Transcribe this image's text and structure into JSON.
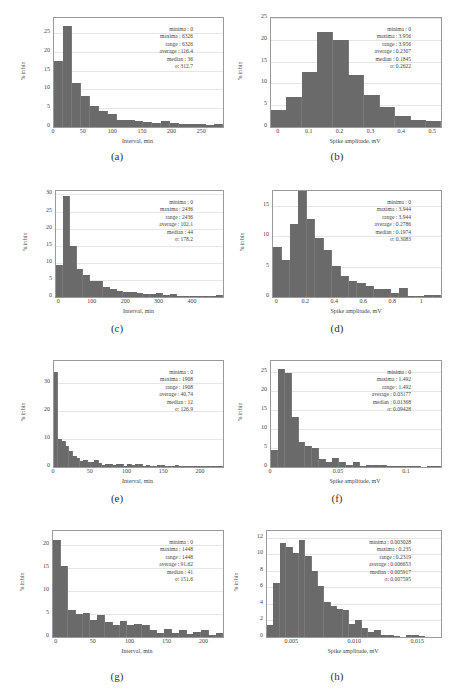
{
  "chart_data": [
    {
      "id": "a",
      "type": "bar",
      "caption": "(a)",
      "xlabel": "Interval, min",
      "ylabel": "% in bin",
      "xlim": [
        0,
        285
      ],
      "ylim": [
        0,
        29
      ],
      "xticks": [
        0,
        50,
        100,
        150,
        200,
        250
      ],
      "yticks": [
        0,
        5,
        10,
        15,
        20,
        25
      ],
      "bin_width": 15,
      "values": [
        17.6,
        26.8,
        11.7,
        8.3,
        5.6,
        4.2,
        3.5,
        1.9,
        1.9,
        1.7,
        1.3,
        1.1,
        1.6,
        1.2,
        0.8,
        0.9,
        0.7,
        0.6,
        0.7
      ],
      "stats": {
        "minima": "0",
        "maxima": "6326",
        "range": "6326",
        "average": "116.4",
        "median": "36",
        "sigma": "312.7"
      }
    },
    {
      "id": "b",
      "type": "bar",
      "caption": "(b)",
      "xlabel": "Spike amplitude, mV",
      "ylabel": "% in bin",
      "xlim": [
        -0.025,
        0.525
      ],
      "ylim": [
        0,
        25
      ],
      "xticks": [
        0,
        0.1,
        0.2,
        0.3,
        0.4,
        0.5
      ],
      "yticks": [
        0,
        5,
        10,
        15,
        20,
        25
      ],
      "bin_start": -0.025,
      "bin_width": 0.05,
      "values": [
        3.8,
        6.9,
        12.7,
        21.8,
        20.0,
        11.9,
        7.3,
        4.7,
        2.6,
        1.7,
        1.4
      ],
      "stats": {
        "minima": "0",
        "maxima": "3.956",
        "range": "3.956",
        "average": "0.2307",
        "median": "0.1845",
        "sigma": "0.2622"
      }
    },
    {
      "id": "c",
      "type": "bar",
      "caption": "(c)",
      "xlabel": "Interval, min",
      "ylabel": "% in bin",
      "xlim": [
        -10,
        490
      ],
      "ylim": [
        0,
        31
      ],
      "xticks": [
        0,
        100,
        200,
        300,
        400
      ],
      "yticks": [
        0,
        5,
        10,
        15,
        20,
        25,
        30
      ],
      "bin_start": -10,
      "bin_width": 20,
      "values": [
        9.5,
        29.5,
        14.8,
        8.3,
        6.5,
        4.7,
        4.6,
        3.0,
        2.4,
        1.8,
        1.4,
        1.4,
        1.3,
        1.0,
        0.9,
        1.1,
        0.5,
        0.8,
        0.3,
        0.3,
        0.3,
        0.3,
        0.4,
        0.4,
        0.5
      ],
      "stats": {
        "minima": "0",
        "maxima": "2436",
        "range": "2436",
        "average": "102.1",
        "median": "44",
        "sigma": "178.2"
      }
    },
    {
      "id": "d",
      "type": "bar",
      "caption": "(d)",
      "xlabel": "Spike amplitude, mV",
      "ylabel": "% in bin",
      "xlim": [
        -0.03,
        1.13
      ],
      "ylim": [
        0,
        17.5
      ],
      "xticks": [
        0,
        0.2,
        0.4,
        0.6,
        0.8,
        1.0
      ],
      "yticks": [
        0,
        5,
        10,
        15
      ],
      "bin_start": -0.03,
      "bin_width": 0.058,
      "values": [
        8.2,
        6.1,
        12.0,
        17.5,
        12.8,
        9.7,
        7.8,
        5.1,
        3.4,
        2.7,
        2.3,
        1.8,
        1.3,
        1.3,
        0.7,
        1.5,
        0.2,
        0.2,
        0.4,
        0.3,
        0.2
      ],
      "stats": {
        "minima": "0",
        "maxima": "3.944",
        "range": "3.944",
        "average": "0.2786",
        "median": "0.1974",
        "sigma": "0.3083"
      }
    },
    {
      "id": "e",
      "type": "bar",
      "caption": "(e)",
      "xlabel": "Interval, min",
      "ylabel": "% in bin",
      "xlim": [
        0,
        230
      ],
      "ylim": [
        0,
        38
      ],
      "xticks": [
        0,
        50,
        100,
        150,
        200
      ],
      "yticks": [
        0,
        10,
        20,
        30
      ],
      "bin_width": 5,
      "values": [
        34.2,
        10.1,
        9.2,
        7.5,
        5.6,
        3.8,
        3.3,
        2.0,
        2.5,
        1.7,
        1.9,
        2.4,
        1.6,
        0.7,
        1.0,
        1.1,
        0.7,
        1.0,
        1.2,
        0.5,
        1.0,
        0.8,
        1.1,
        1.0,
        0.5,
        0.7,
        0.4,
        0.5,
        0.8,
        0.9,
        0.5,
        0.4,
        0.3,
        0.6,
        0.5,
        0.3,
        0.3,
        0.4,
        0.4,
        0.3,
        0.5,
        0.2,
        0.2,
        0.3,
        0.3,
        0.2
      ],
      "stats": {
        "minima": "0",
        "maxima": "1908",
        "range": "1908",
        "average": "40.74",
        "median": "12",
        "sigma": "126.9"
      }
    },
    {
      "id": "f",
      "type": "bar",
      "caption": "(f)",
      "xlabel": "Spike amplitude, mV",
      "ylabel": "% in bin",
      "xlim": [
        0,
        0.125
      ],
      "ylim": [
        0,
        28
      ],
      "xticks": [
        0,
        0.05,
        0.1
      ],
      "ytick_labels": [
        "0",
        "5",
        "10",
        "15",
        "20",
        "25"
      ],
      "yticks": [
        0,
        5,
        10,
        15,
        20,
        25
      ],
      "bin_width": 0.005,
      "values": [
        4.4,
        25.9,
        24.9,
        13.1,
        6.7,
        5.5,
        4.9,
        2.0,
        1.3,
        2.3,
        1.4,
        0.6,
        1.2,
        0.4,
        0.5,
        0.6,
        0.6,
        0.3,
        0.2,
        0.3,
        0.4,
        0.2,
        0.1,
        0.4,
        0.3
      ],
      "stats": {
        "minima": "0",
        "maxima": "1.492",
        "range": "1.492",
        "average": "0.03177",
        "median": "0.01368",
        "sigma": "0.09428"
      }
    },
    {
      "id": "g",
      "type": "bar",
      "caption": "(g)",
      "xlabel": "Interval, min",
      "ylabel": "% in bin",
      "xlim": [
        -5,
        225
      ],
      "ylim": [
        0,
        23
      ],
      "xticks": [
        0,
        50,
        100,
        150,
        200
      ],
      "yticks": [
        0,
        5,
        10,
        15,
        20
      ],
      "bin_start": -5,
      "bin_width": 10,
      "values": [
        21.0,
        15.4,
        5.8,
        5.1,
        5.2,
        3.6,
        4.8,
        3.3,
        2.5,
        3.5,
        2.5,
        2.8,
        2.6,
        1.5,
        0.9,
        1.7,
        0.9,
        1.5,
        0.7,
        1.0,
        1.6,
        0.4,
        0.8
      ],
      "stats": {
        "minima": "0",
        "maxima": "1448",
        "range": "1448",
        "average": "91.62",
        "median": "41",
        "sigma": "151.6"
      }
    },
    {
      "id": "h",
      "type": "bar",
      "caption": "(h)",
      "xlabel": "Spike amplitude, mV",
      "ylabel": "% in bin",
      "xlim": [
        0.003,
        0.0168
      ],
      "ylim": [
        0,
        12.8
      ],
      "xticks": [
        0.005,
        0.01,
        0.015
      ],
      "xtick_labels": [
        "0.005",
        "0.010",
        "0.015"
      ],
      "yticks": [
        0,
        2,
        4,
        6,
        8,
        10,
        12
      ],
      "bin_start": 0.003,
      "bin_width": 0.0005,
      "values": [
        1.5,
        6.5,
        11.3,
        10.9,
        10.2,
        11.7,
        9.8,
        8.0,
        6.2,
        4.2,
        3.8,
        3.4,
        3.3,
        1.6,
        2.1,
        1.1,
        0.6,
        0.9,
        0.3,
        0.3,
        0.1,
        0.0,
        0.2,
        0.2,
        0.1
      ],
      "stats": {
        "minima": "0.003028",
        "maxima": "0.235",
        "range": "0.2319",
        "average": "0.006653",
        "median": "0.005917",
        "sigma": "0.007595"
      }
    }
  ],
  "stat_labels": {
    "minima": "minima : ",
    "maxima": "maxima : ",
    "range": "range : ",
    "average": "average : ",
    "median": "median : ",
    "sigma": "σ: "
  },
  "colors": {
    "bar": "#6a6a6a",
    "frame": "#9a9a9a",
    "grid": "#e6e6e6"
  }
}
